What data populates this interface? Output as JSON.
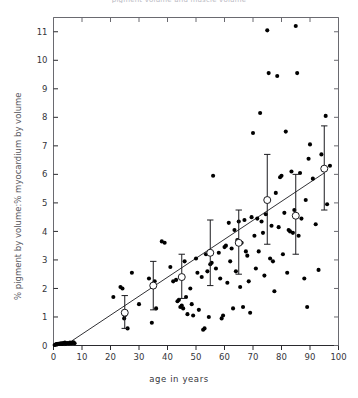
{
  "figure": {
    "title": "pigment volume and muscle volume",
    "xlabel": "age in years",
    "ylabel": "% pigment by volume:% myocardium by volume"
  },
  "chart_data": {
    "type": "scatter",
    "title": "pigment volume and muscle volume",
    "xlabel": "age in years",
    "ylabel": "% pigment by volume:% myocardium by volume",
    "xlim": [
      0,
      100
    ],
    "ylim": [
      0,
      11.5
    ],
    "xticks": [
      0,
      10,
      20,
      30,
      40,
      50,
      60,
      70,
      80,
      90,
      100
    ],
    "yticks": [
      0,
      1,
      2,
      3,
      4,
      5,
      6,
      7,
      8,
      9,
      10,
      11
    ],
    "xtick_labels": [
      "0",
      "10",
      "20",
      "30",
      "40",
      "50",
      "60",
      "70",
      "80",
      "90",
      "100"
    ],
    "ytick_labels": [
      "0",
      "1",
      "2",
      "3",
      "4",
      "5",
      "6",
      "7",
      "8",
      "9",
      "10",
      "11"
    ],
    "grid": false,
    "legend": null,
    "marker": "filled-circle",
    "series": [
      {
        "name": "individual subjects",
        "marker": "filled-circle",
        "color": "#000000",
        "points": [
          [
            0.4,
            0.02
          ],
          [
            0.8,
            0.03
          ],
          [
            1.0,
            0.05
          ],
          [
            1.3,
            0.04
          ],
          [
            1.6,
            0.06
          ],
          [
            1.9,
            0.05
          ],
          [
            2.2,
            0.07
          ],
          [
            2.5,
            0.06
          ],
          [
            2.8,
            0.08
          ],
          [
            3.1,
            0.05
          ],
          [
            3.4,
            0.09
          ],
          [
            3.7,
            0.07
          ],
          [
            4.0,
            0.1
          ],
          [
            4.3,
            0.06
          ],
          [
            4.6,
            0.08
          ],
          [
            5.0,
            0.09
          ],
          [
            5.4,
            0.07
          ],
          [
            5.8,
            0.1
          ],
          [
            6.2,
            0.08
          ],
          [
            6.6,
            0.09
          ],
          [
            7.0,
            0.11
          ],
          [
            7.4,
            0.08
          ],
          [
            21.0,
            1.7
          ],
          [
            23.5,
            2.05
          ],
          [
            24.2,
            2.0
          ],
          [
            24.8,
            0.95
          ],
          [
            25.0,
            1.05
          ],
          [
            26.0,
            0.6
          ],
          [
            27.5,
            2.55
          ],
          [
            30.0,
            1.45
          ],
          [
            33.5,
            2.35
          ],
          [
            34.5,
            0.8
          ],
          [
            35.5,
            2.25
          ],
          [
            36.0,
            1.3
          ],
          [
            38.0,
            3.65
          ],
          [
            39.0,
            3.6
          ],
          [
            41.0,
            2.75
          ],
          [
            42.0,
            2.25
          ],
          [
            43.0,
            2.3
          ],
          [
            43.5,
            1.55
          ],
          [
            44.0,
            1.6
          ],
          [
            44.5,
            1.35
          ],
          [
            45.0,
            1.4
          ],
          [
            45.5,
            1.3
          ],
          [
            46.0,
            2.95
          ],
          [
            46.5,
            1.7
          ],
          [
            47.0,
            1.1
          ],
          [
            48.0,
            2.0
          ],
          [
            48.5,
            1.45
          ],
          [
            49.0,
            1.05
          ],
          [
            50.0,
            3.05
          ],
          [
            50.5,
            2.55
          ],
          [
            51.0,
            1.25
          ],
          [
            52.0,
            2.4
          ],
          [
            52.5,
            0.55
          ],
          [
            53.0,
            0.6
          ],
          [
            53.5,
            3.2
          ],
          [
            54.0,
            2.6
          ],
          [
            54.5,
            1.0
          ],
          [
            55.0,
            2.85
          ],
          [
            55.5,
            2.9
          ],
          [
            56.0,
            5.95
          ],
          [
            57.0,
            2.7
          ],
          [
            58.0,
            3.25
          ],
          [
            58.5,
            2.35
          ],
          [
            59.0,
            0.95
          ],
          [
            59.5,
            1.05
          ],
          [
            60.0,
            3.45
          ],
          [
            60.5,
            3.5
          ],
          [
            61.0,
            2.2
          ],
          [
            61.5,
            4.3
          ],
          [
            62.0,
            2.95
          ],
          [
            62.5,
            3.4
          ],
          [
            63.0,
            1.3
          ],
          [
            63.5,
            4.05
          ],
          [
            64.0,
            2.6
          ],
          [
            64.5,
            3.7
          ],
          [
            65.0,
            4.35
          ],
          [
            65.5,
            2.05
          ],
          [
            66.0,
            3.6
          ],
          [
            66.5,
            1.35
          ],
          [
            67.0,
            4.4
          ],
          [
            67.5,
            3.3
          ],
          [
            68.0,
            3.15
          ],
          [
            68.5,
            2.25
          ],
          [
            69.0,
            1.15
          ],
          [
            69.5,
            4.5
          ],
          [
            70.0,
            7.45
          ],
          [
            70.5,
            3.85
          ],
          [
            71.0,
            2.7
          ],
          [
            71.5,
            4.45
          ],
          [
            72.0,
            3.3
          ],
          [
            72.5,
            8.15
          ],
          [
            73.0,
            4.35
          ],
          [
            73.5,
            3.95
          ],
          [
            74.0,
            2.45
          ],
          [
            74.5,
            4.6
          ],
          [
            75.0,
            11.05
          ],
          [
            75.5,
            9.55
          ],
          [
            76.0,
            3.05
          ],
          [
            76.5,
            4.2
          ],
          [
            77.0,
            2.95
          ],
          [
            77.5,
            1.9
          ],
          [
            78.0,
            5.35
          ],
          [
            78.5,
            9.45
          ],
          [
            79.0,
            4.15
          ],
          [
            79.5,
            5.9
          ],
          [
            80.0,
            5.95
          ],
          [
            80.5,
            3.2
          ],
          [
            81.0,
            4.65
          ],
          [
            81.5,
            7.5
          ],
          [
            82.0,
            2.55
          ],
          [
            82.5,
            4.05
          ],
          [
            83.0,
            4.0
          ],
          [
            83.5,
            6.1
          ],
          [
            84.0,
            3.95
          ],
          [
            84.5,
            4.75
          ],
          [
            85.0,
            11.2
          ],
          [
            85.5,
            9.55
          ],
          [
            86.0,
            3.85
          ],
          [
            86.5,
            6.05
          ],
          [
            87.0,
            4.45
          ],
          [
            88.0,
            2.35
          ],
          [
            88.5,
            5.1
          ],
          [
            89.0,
            1.35
          ],
          [
            89.5,
            6.55
          ],
          [
            90.0,
            7.05
          ],
          [
            91.0,
            5.85
          ],
          [
            92.0,
            4.25
          ],
          [
            93.0,
            2.65
          ],
          [
            94.0,
            6.7
          ],
          [
            95.5,
            8.05
          ],
          [
            96.0,
            4.95
          ],
          [
            97.0,
            6.3
          ]
        ]
      }
    ],
    "means": {
      "name": "decade mean ± SE",
      "marker": "open-circle",
      "color": "#000000",
      "points": [
        {
          "x": 25,
          "y": 1.15,
          "yerr_low": 0.55,
          "yerr_high": 0.6
        },
        {
          "x": 35,
          "y": 2.1,
          "yerr_low": 0.85,
          "yerr_high": 0.85
        },
        {
          "x": 45,
          "y": 2.4,
          "yerr_low": 0.75,
          "yerr_high": 0.8
        },
        {
          "x": 55,
          "y": 3.25,
          "yerr_low": 1.15,
          "yerr_high": 1.15
        },
        {
          "x": 65,
          "y": 3.6,
          "yerr_low": 1.1,
          "yerr_high": 1.15
        },
        {
          "x": 75,
          "y": 5.1,
          "yerr_low": 1.55,
          "yerr_high": 1.6
        },
        {
          "x": 85,
          "y": 4.55,
          "yerr_low": 1.35,
          "yerr_high": 1.45
        },
        {
          "x": 95,
          "y": 6.2,
          "yerr_low": 1.45,
          "yerr_high": 1.5
        }
      ]
    },
    "regression_line": {
      "x0": 4,
      "y0": 0.0,
      "x1": 95,
      "y1": 6.05
    }
  }
}
